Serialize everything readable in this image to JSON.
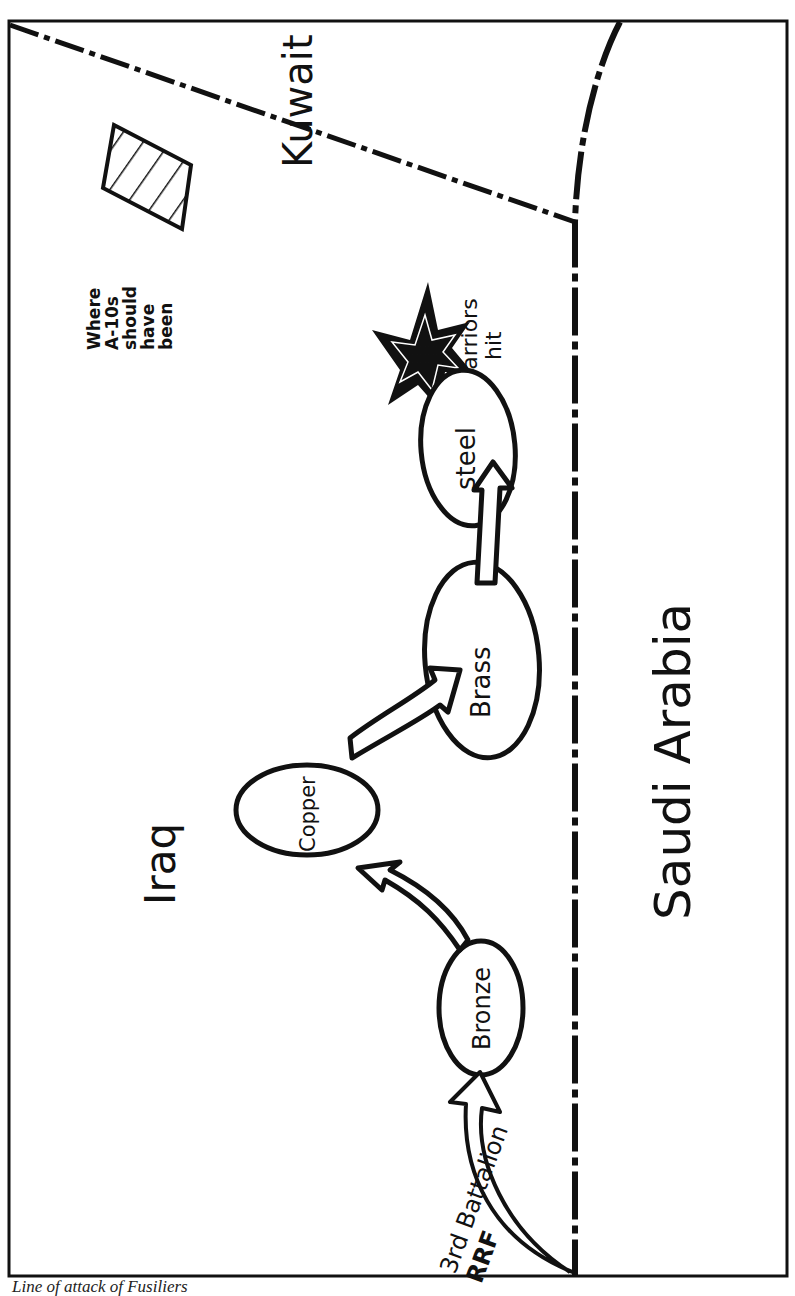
{
  "map": {
    "regions": {
      "kuwait": "Kuwait",
      "iraq": "Iraq",
      "saudi_arabia": "Saudi Arabia"
    },
    "objectives": [
      {
        "name": "Bronze"
      },
      {
        "name": "Copper"
      },
      {
        "name": "Brass"
      },
      {
        "name": "steel"
      }
    ],
    "start_unit": {
      "line1": "3rd Battalion",
      "line2": "RRF"
    },
    "hit_label": {
      "line1": "Warriors",
      "line2": "hit"
    },
    "a10_label": {
      "line1": "Where",
      "line2": "A-10s",
      "line3": "should",
      "line4": "have",
      "line5": "been"
    },
    "colors": {
      "ink": "#111111",
      "paper": "#ffffff",
      "caption": "#222222"
    }
  },
  "caption": "Line of attack of Fusiliers"
}
